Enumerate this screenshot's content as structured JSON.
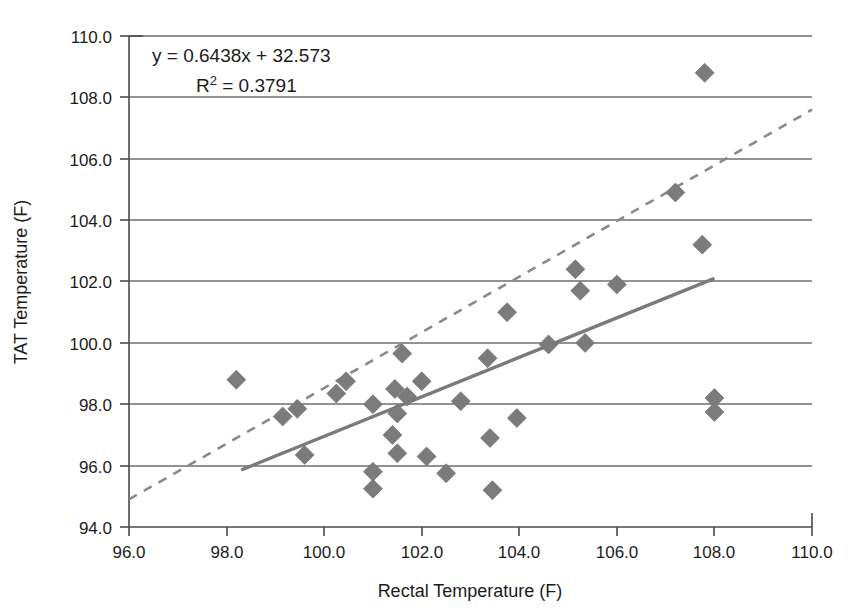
{
  "chart_data": {
    "type": "scatter",
    "title": "",
    "xlabel": "Rectal Temperature (F)",
    "ylabel": "TAT Temperature (F)",
    "xlim": [
      96.0,
      110.0
    ],
    "ylim": [
      94.0,
      110.0
    ],
    "xticks": [
      "96.0",
      "98.0",
      "100.0",
      "102.0",
      "104.0",
      "106.0",
      "108.0",
      "110.0"
    ],
    "yticks": [
      "94.0",
      "96.0",
      "98.0",
      "100.0",
      "102.0",
      "104.0",
      "106.0",
      "108.0",
      "110.0"
    ],
    "xtick_values": [
      96.0,
      98.0,
      100.0,
      102.0,
      104.0,
      106.0,
      108.0,
      110.0
    ],
    "ytick_values": [
      94.0,
      96.0,
      98.0,
      100.0,
      102.0,
      104.0,
      106.0,
      108.0,
      110.0
    ],
    "grid": "horizontal",
    "legend": "none",
    "annotations": {
      "equation": "y = 0.6438x + 32.573",
      "r_squared_prefix": "R",
      "r_squared_sup": "2",
      "r_squared_value": " = 0.3791"
    },
    "marker_shape": "diamond",
    "marker_color": "#7b7b7b",
    "points": [
      {
        "x": 98.2,
        "y": 98.8
      },
      {
        "x": 99.15,
        "y": 97.6
      },
      {
        "x": 99.45,
        "y": 97.85
      },
      {
        "x": 99.6,
        "y": 96.35
      },
      {
        "x": 100.25,
        "y": 98.35
      },
      {
        "x": 100.45,
        "y": 98.75
      },
      {
        "x": 101.0,
        "y": 98.0
      },
      {
        "x": 101.0,
        "y": 95.8
      },
      {
        "x": 101.0,
        "y": 95.25
      },
      {
        "x": 101.4,
        "y": 97.0
      },
      {
        "x": 101.45,
        "y": 98.5
      },
      {
        "x": 101.5,
        "y": 97.7
      },
      {
        "x": 101.5,
        "y": 96.4
      },
      {
        "x": 101.6,
        "y": 99.65
      },
      {
        "x": 101.7,
        "y": 98.25
      },
      {
        "x": 102.0,
        "y": 98.75
      },
      {
        "x": 102.1,
        "y": 96.3
      },
      {
        "x": 102.5,
        "y": 95.75
      },
      {
        "x": 102.8,
        "y": 98.1
      },
      {
        "x": 103.35,
        "y": 99.5
      },
      {
        "x": 103.4,
        "y": 96.9
      },
      {
        "x": 103.45,
        "y": 95.2
      },
      {
        "x": 103.75,
        "y": 101.0
      },
      {
        "x": 103.95,
        "y": 97.55
      },
      {
        "x": 104.6,
        "y": 99.95
      },
      {
        "x": 105.15,
        "y": 102.4
      },
      {
        "x": 105.25,
        "y": 101.7
      },
      {
        "x": 105.35,
        "y": 100.0
      },
      {
        "x": 106.0,
        "y": 101.9
      },
      {
        "x": 107.2,
        "y": 104.9
      },
      {
        "x": 107.75,
        "y": 103.2
      },
      {
        "x": 107.8,
        "y": 108.8
      },
      {
        "x": 108.0,
        "y": 98.2
      },
      {
        "x": 108.0,
        "y": 97.75
      }
    ],
    "trendline": {
      "style": "solid",
      "slope": 0.6438,
      "intercept": 32.573,
      "x_start": 98.3,
      "x_end": 108.0,
      "color": "#7a7a7a"
    },
    "reference_line": {
      "style": "dashed",
      "x_start": 96.0,
      "y_start": 94.9,
      "x_end": 110.0,
      "y_end": 107.6,
      "color": "#8a8a8a"
    }
  }
}
